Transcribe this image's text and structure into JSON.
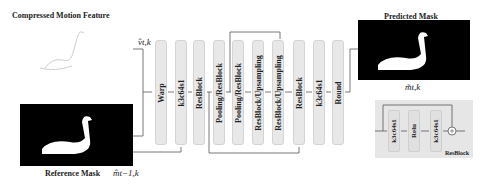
{
  "labels": {
    "compressed_motion": "Compressed Motion Feature",
    "reference_mask": "Reference Mask",
    "reference_mask_symbol": "m̂t−1,k",
    "motion_symbol": "v̂t,k",
    "predicted_mask": "Predicted Mask",
    "predicted_mask_symbol": "m̃t,k"
  },
  "blocks": [
    {
      "label": "Warp"
    },
    {
      "label": "k3c64s1"
    },
    {
      "label": "ResBlock"
    },
    {
      "label": "Pooling/ResBlock"
    },
    {
      "label": "Pooling/ResBlock"
    },
    {
      "label": "ResBlock/Upsampling"
    },
    {
      "label": "ResBlock/Upsampling"
    },
    {
      "label": "ResBlock"
    },
    {
      "label": "k3c64s1"
    },
    {
      "label": "Round"
    }
  ],
  "resblock_detail": {
    "title": "ResBlock",
    "layers": [
      "k3c64s1",
      "Relu",
      "k3c64s1"
    ]
  },
  "colors": {
    "block_fill": "#e8e8e8",
    "arrow": "#333333",
    "mask_bg": "#000000"
  }
}
